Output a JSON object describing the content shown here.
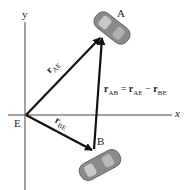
{
  "diagram": {
    "axes": {
      "x_label": "x",
      "y_label": "y"
    },
    "points": {
      "origin": "E",
      "car_a": "A",
      "car_b": "B"
    },
    "vectors": {
      "r_ae": {
        "main": "r",
        "sub": "AE"
      },
      "r_be": {
        "main": "r",
        "sub": "BE"
      }
    },
    "equation": {
      "lhs_sub": "AB",
      "rhs1_sub": "AE",
      "rhs2_sub": "BE",
      "eq": "=",
      "minus": "−",
      "r": "r"
    },
    "colors": {
      "axis": "#444444",
      "vector": "#111111",
      "car_body": "#8a8a8a",
      "car_light": "#c8c8c8"
    }
  }
}
